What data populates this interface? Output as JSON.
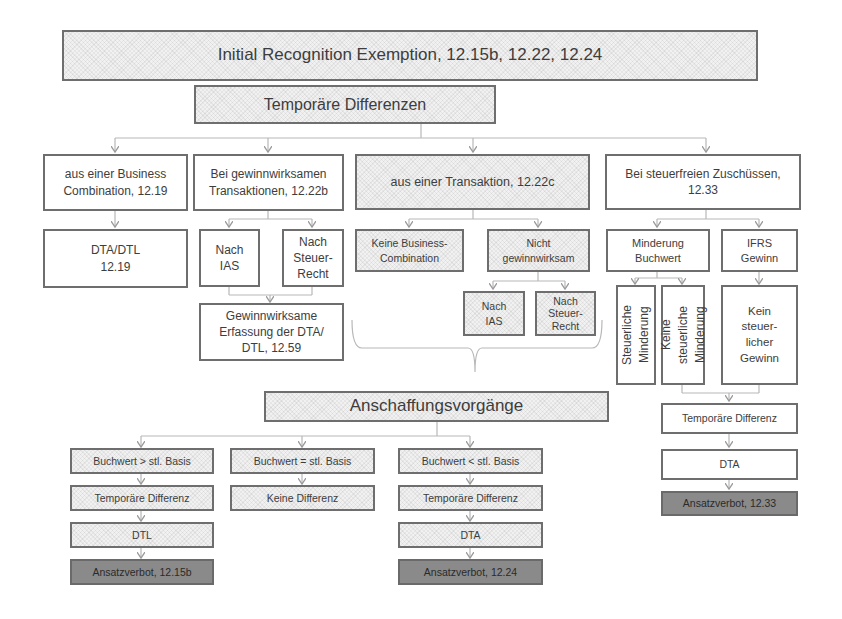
{
  "header": {
    "title": "Initial Recognition Exemption, 12.15b, 12.22, 12.24",
    "subtitle": "Temporäre Differenzen"
  },
  "branches": {
    "business_combination": {
      "label": "aus einer Business\nCombination, 12.19",
      "result": "DTA/DTL\n12.19"
    },
    "gewinnwirksam": {
      "label": "Bei gewinnwirksamen\nTransaktionen, 12.22b",
      "nach_ias": "Nach\nIAS",
      "nach_steuerrecht": "Nach\nSteuer-\nRecht",
      "result": "Gewinnwirksame\nErfassung der DTA/\nDTL, 12.59"
    },
    "transaktion": {
      "label": "aus einer Transaktion, 12.22c",
      "keine_business": "Keine Business-\nCombination",
      "nicht_gewinnwirksam": "Nicht\ngewinnwirksam",
      "nach_ias": "Nach\nIAS",
      "nach_steuerrecht": "Nach\nSteuer-\nRecht"
    },
    "zuschuesse": {
      "label": "Bei steuerfreien Zuschüssen,\n12.33",
      "minderung_buchwert": "Minderung\nBuchwert",
      "ifrs_gewinn": "IFRS\nGewinn",
      "steuerliche_minderung": "Steuerliche\nMinderung",
      "keine_steuerliche_minderung": "Keine\nsteuerliche\nMinderung",
      "kein_steuerlicher_gewinn": "Kein\nsteuer-\nlicher\nGewinn",
      "temp_diff": "Temporäre Differenz",
      "dta": "DTA",
      "verbot": "Ansatzverbot, 12.33"
    }
  },
  "anschaffung": {
    "title": "Anschaffungsvorgänge",
    "columns": [
      {
        "condition": "Buchwert > stl. Basis",
        "diff": "Temporäre Differenz",
        "type": "DTL",
        "verbot": "Ansatzverbot, 12.15b"
      },
      {
        "condition": "Buchwert = stl. Basis",
        "diff": "Keine Differenz"
      },
      {
        "condition": "Buchwert < stl. Basis",
        "diff": "Temporäre Differenz",
        "type": "DTA",
        "verbot": "Ansatzverbot, 12.24"
      }
    ]
  },
  "colors": {
    "border": "#6e6e6e",
    "connector": "#b0b0b0",
    "hatch_fill": "#f1f1f1",
    "verbot_fill": "#8a8a8a"
  }
}
